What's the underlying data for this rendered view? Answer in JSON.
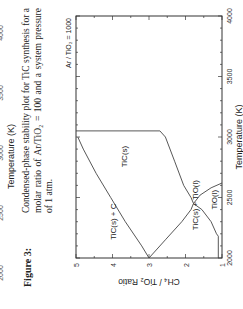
{
  "previous_figure": {
    "x_tick_labels": [
      "2000",
      "2500",
      "3000",
      "3500",
      "4000"
    ],
    "x_axis_label": "Temperature (K)"
  },
  "figure": {
    "label": "Figure 3:",
    "caption": "Condensed-phase stability plot for TiC synthesis for a molar ratio of Ar/TiO₂ = 100 and a system pressure of 1 atm."
  },
  "chart_data": {
    "type": "line",
    "title": "",
    "annotation": "Ar / TiO₂ = 1000",
    "xlabel": "Temperature (K)",
    "ylabel": "CH₄ / TiO₂ Ratio",
    "xlim": [
      2000,
      4000
    ],
    "ylim": [
      1,
      5
    ],
    "x_ticks": [
      2000,
      2500,
      3000,
      3500,
      4000
    ],
    "y_ticks": [
      1,
      2,
      3,
      4,
      5
    ],
    "grid": false,
    "regions": [
      {
        "label": "TiC(s) + C",
        "x": 2150,
        "y": 3.9
      },
      {
        "label": "TiC(s)",
        "x": 2750,
        "y": 3.6
      },
      {
        "label": "TiC(s) + TiO(l)",
        "x": 2230,
        "y": 1.65
      },
      {
        "label": "TiO(l)",
        "x": 2400,
        "y": 1.15
      }
    ],
    "series": [
      {
        "name": "TiC(s)+C / TiC(s) boundary",
        "points": [
          [
            2000,
            3.0
          ],
          [
            2100,
            3.2
          ],
          [
            2300,
            3.65
          ],
          [
            2500,
            4.05
          ],
          [
            2700,
            4.45
          ],
          [
            2900,
            4.8
          ],
          [
            3000,
            4.95
          ]
        ]
      },
      {
        "name": "TiC(s) upper boundary",
        "points": [
          [
            3050,
            5.0
          ],
          [
            3050,
            2.7
          ],
          [
            3000,
            2.55
          ],
          [
            2800,
            2.3
          ],
          [
            2600,
            2.05
          ],
          [
            2500,
            1.85
          ],
          [
            2450,
            1.78
          ]
        ]
      },
      {
        "name": "TiC(s)+TiO(l) dome",
        "points": [
          [
            2000,
            3.0
          ],
          [
            2150,
            2.55
          ],
          [
            2300,
            2.1
          ],
          [
            2400,
            1.85
          ],
          [
            2450,
            1.78
          ],
          [
            2400,
            1.55
          ],
          [
            2300,
            1.3
          ],
          [
            2200,
            1.15
          ],
          [
            2180,
            1.1
          ],
          [
            2000,
            1.1
          ]
        ]
      },
      {
        "name": "TiO(l) boundary",
        "points": [
          [
            2450,
            1.78
          ],
          [
            2520,
            1.6
          ],
          [
            2580,
            1.3
          ],
          [
            2620,
            1.0
          ]
        ]
      }
    ]
  }
}
